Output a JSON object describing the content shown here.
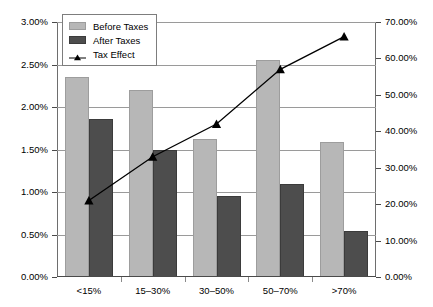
{
  "chart_data": {
    "type": "bar",
    "title": "",
    "subtitle": "",
    "xlabel": "",
    "ylabel": "",
    "grid": true,
    "legend_position": "top-left",
    "categories": [
      "<15%",
      "15–30%",
      "30–50%",
      "50–70%",
      ">70%"
    ],
    "series": [
      {
        "name": "Before Taxes",
        "type": "bar",
        "axis": "left",
        "color": "#b7b7b7",
        "values": [
          2.35,
          2.2,
          1.62,
          2.55,
          1.59
        ]
      },
      {
        "name": "After Taxes",
        "type": "bar",
        "axis": "left",
        "color": "#4d4d4d",
        "values": [
          1.86,
          1.5,
          0.95,
          1.1,
          0.54
        ]
      },
      {
        "name": "Tax Effect",
        "type": "line",
        "axis": "right",
        "color": "#000000",
        "marker": "triangle",
        "values": [
          21.0,
          33.0,
          42.0,
          57.0,
          66.0
        ]
      }
    ],
    "left_axis": {
      "min": 0.0,
      "max": 3.0,
      "step": 0.5,
      "ticks": [
        "0.00%",
        "0.50%",
        "1.00%",
        "1.50%",
        "2.00%",
        "2.50%",
        "3.00%"
      ]
    },
    "right_axis": {
      "min": 0.0,
      "max": 70.0,
      "step": 10.0,
      "ticks": [
        "0.00%",
        "10.00%",
        "20.00%",
        "30.00%",
        "40.00%",
        "50.00%",
        "60.00%",
        "70.00%"
      ]
    }
  },
  "legend": {
    "items": [
      {
        "label": "Before Taxes",
        "swatch": "before"
      },
      {
        "label": "After Taxes",
        "swatch": "after"
      },
      {
        "label": "Tax Effect",
        "swatch": "marker"
      }
    ]
  }
}
